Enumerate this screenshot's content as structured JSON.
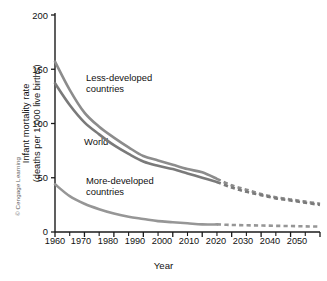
{
  "figure": {
    "credit": "© Cengage Learning"
  },
  "chart_data": {
    "type": "line",
    "title": "",
    "xlabel": "Year",
    "ylabel": "Infant mortality rate (deaths per 1,000 live births)",
    "ylabel_line1": "Infant mortality rate",
    "ylabel_line2": "(deaths per 1,000 live births)",
    "xlim": [
      1960,
      2050
    ],
    "ylim": [
      0,
      200
    ],
    "yticks": [
      0,
      50,
      100,
      150,
      200
    ],
    "ytick_labels": [
      "0",
      "50",
      "100",
      "150",
      "200"
    ],
    "xticks": [
      1960,
      1970,
      1980,
      1990,
      2000,
      2010,
      2020,
      2030,
      2040,
      2050
    ],
    "xtick_labels": [
      "1960",
      "1970",
      "1980",
      "1990",
      "2000",
      "2010",
      "2020",
      "2030",
      "2040",
      "2050"
    ],
    "x_minor_tick_interval": 5,
    "grid": false,
    "legend_position": "inline-annotations",
    "projection_start_year": 2015,
    "x": [
      1960,
      1965,
      1970,
      1975,
      1980,
      1985,
      1990,
      1995,
      2000,
      2005,
      2010,
      2015,
      2020,
      2025,
      2030,
      2035,
      2040,
      2045,
      2050
    ],
    "series": [
      {
        "name": "Less-developed countries",
        "label": "Less-developed countries",
        "label_line1": "Less-developed",
        "label_line2": "countries",
        "color": "#8c8c8c",
        "values": [
          157,
          131,
          110,
          97,
          87,
          78,
          70,
          66,
          62,
          58,
          55,
          49,
          43,
          39,
          35,
          32,
          30,
          28,
          26
        ]
      },
      {
        "name": "World",
        "label": "World",
        "label_line1": "World",
        "label_line2": "",
        "color": "#7a7a7a",
        "values": [
          137,
          117,
          101,
          90,
          80,
          72,
          65,
          61,
          58,
          54,
          50,
          46,
          41,
          37,
          34,
          31,
          29,
          27,
          25
        ]
      },
      {
        "name": "More-developed countries",
        "label": "More-developed countries",
        "label_line1": "More-developed",
        "label_line2": "countries",
        "color": "#969696",
        "values": [
          44,
          33,
          26,
          21,
          17,
          14,
          12,
          10,
          9,
          8,
          7,
          7,
          6.5,
          6.2,
          6,
          5.7,
          5.5,
          5.2,
          5
        ]
      }
    ],
    "annotations": [
      {
        "text": "Less-developed countries",
        "x": 1975,
        "y": 130
      },
      {
        "text": "World",
        "x": 1974,
        "y": 73
      },
      {
        "text": "More-developed countries",
        "x": 1975,
        "y": 46
      }
    ]
  }
}
